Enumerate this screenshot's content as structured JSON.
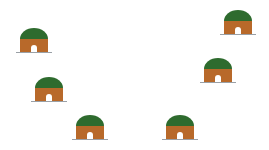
{
  "scene": {
    "background": "#ffffff",
    "colors": {
      "roof": "#2e6b2e",
      "wall": "#b8692a",
      "door": "#ffffff",
      "ground": "#9aa0a6"
    },
    "huts": [
      {
        "id": "hut-1",
        "x": 16,
        "y": 28
      },
      {
        "id": "hut-2",
        "x": 220,
        "y": 10
      },
      {
        "id": "hut-3",
        "x": 200,
        "y": 58
      },
      {
        "id": "hut-4",
        "x": 31,
        "y": 77
      },
      {
        "id": "hut-5",
        "x": 72,
        "y": 115
      },
      {
        "id": "hut-6",
        "x": 162,
        "y": 115
      }
    ]
  }
}
